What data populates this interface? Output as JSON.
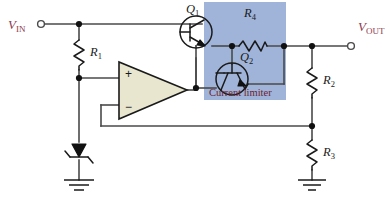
{
  "diagram": {
    "type": "schematic",
    "background_color": "#ffffff"
  },
  "terminals": [
    {
      "id": "vin",
      "label_main": "V",
      "label_sub": "IN",
      "color": "#8d3a4e"
    },
    {
      "id": "vout",
      "label_main": "V",
      "label_sub": "OUT",
      "color": "#8d3a4e"
    }
  ],
  "components": {
    "r1": {
      "label_main": "R",
      "label_sub": "1",
      "kind": "resistor"
    },
    "r2": {
      "label_main": "R",
      "label_sub": "2",
      "kind": "resistor"
    },
    "r3": {
      "label_main": "R",
      "label_sub": "3",
      "kind": "resistor"
    },
    "r4": {
      "label_main": "R",
      "label_sub": "4",
      "kind": "resistor"
    },
    "q1": {
      "label_main": "Q",
      "label_sub": "1",
      "kind": "npn-transistor"
    },
    "q2": {
      "label_main": "Q",
      "label_sub": "2",
      "kind": "npn-transistor"
    },
    "zener": {
      "label_main": "",
      "label_sub": "",
      "kind": "zener-diode"
    },
    "opamp": {
      "plus": "+",
      "minus": "−",
      "kind": "op-amp",
      "fill_color": "#e8e6ce"
    }
  },
  "annotations": {
    "current_limiter": {
      "label": "Current limiter",
      "box_color": "#9fb4d8",
      "text_color": "#6d2230"
    }
  },
  "grounds": [
    {
      "id": "gnd-zener"
    },
    {
      "id": "gnd-r3"
    }
  ],
  "colors": {
    "wire": "#4a4a4a",
    "component_outline": "#1a1a1a",
    "terminal_label": "#8d3a4e",
    "limiter_fill": "#9fb4d8",
    "opamp_fill": "#e8e6ce"
  }
}
